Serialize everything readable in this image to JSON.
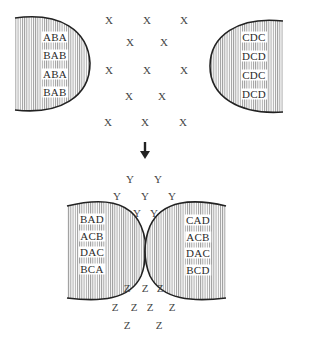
{
  "diagram": {
    "title": "",
    "colors": {
      "stroke": "#222222",
      "hatch": "#8a8a8a",
      "text": "#333333",
      "background": "#ffffff"
    },
    "top_panel": {
      "left_surface": {
        "labels": [
          "ABA",
          "BAB",
          "ABA",
          "BAB"
        ]
      },
      "right_surface": {
        "labels": [
          "CDC",
          "DCD",
          "CDC",
          "DCD"
        ]
      },
      "particles": {
        "symbol": "X",
        "positions": [
          [
            109,
            20
          ],
          [
            147,
            20
          ],
          [
            184,
            20
          ],
          [
            130,
            42
          ],
          [
            164,
            42
          ],
          [
            109,
            70
          ],
          [
            147,
            70
          ],
          [
            184,
            70
          ],
          [
            129,
            96
          ],
          [
            162,
            96
          ],
          [
            108,
            122
          ],
          [
            145,
            122
          ],
          [
            183,
            122
          ]
        ]
      }
    },
    "arrow": {
      "direction": "down",
      "glyph": "arrow-down"
    },
    "bottom_panel": {
      "left_surface": {
        "labels": [
          "BAD",
          "ACB",
          "DAC",
          "BCA"
        ]
      },
      "right_surface": {
        "labels": [
          "CAD",
          "ACB",
          "DAC",
          "BCD"
        ]
      },
      "particles_top": {
        "symbol": "Y",
        "positions": [
          [
            130,
            179
          ],
          [
            158,
            179
          ],
          [
            117,
            196
          ],
          [
            145,
            196
          ],
          [
            172,
            196
          ],
          [
            137,
            213
          ],
          [
            154,
            213
          ]
        ]
      },
      "particles_bottom": {
        "symbol": "Z",
        "positions": [
          [
            127,
            288
          ],
          [
            145,
            288
          ],
          [
            160,
            288
          ],
          [
            115,
            307
          ],
          [
            134,
            307
          ],
          [
            150,
            307
          ],
          [
            172,
            307
          ],
          [
            127,
            325
          ],
          [
            159,
            325
          ]
        ]
      }
    }
  }
}
